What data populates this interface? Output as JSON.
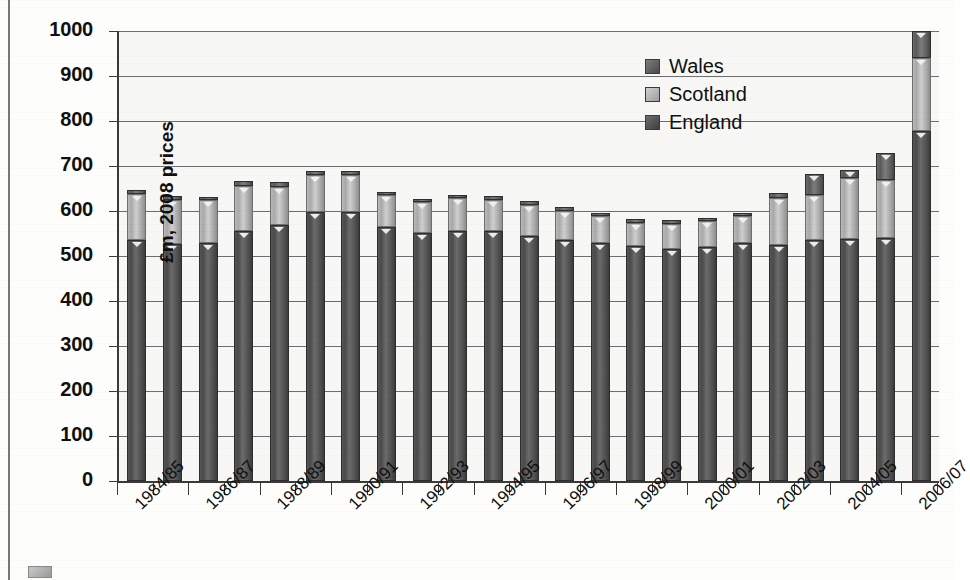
{
  "chart_data": {
    "type": "bar",
    "subtype": "stacked",
    "title": "",
    "xlabel": "",
    "ylabel": "£m, 2008 prices",
    "ylim": [
      0,
      1000
    ],
    "ytick_step": 100,
    "yticks": [
      "0",
      "100",
      "200",
      "300",
      "400",
      "500",
      "600",
      "700",
      "800",
      "900",
      "1000"
    ],
    "grid": true,
    "legend_position": "top-right",
    "categories": [
      "1984/85",
      "1985/86",
      "1986/87",
      "1987/88",
      "1988/89",
      "1989/90",
      "1990/91",
      "1991/92",
      "1992/93",
      "1993/94",
      "1994/95",
      "1995/96",
      "1996/97",
      "1997/98",
      "1998/99",
      "1999/00",
      "2000/01",
      "2001/02",
      "2002/03",
      "2003/04",
      "2004/05",
      "2005/06",
      "2006/07"
    ],
    "visible_tick_labels": [
      "1984/85",
      "1986/87",
      "1988/89",
      "1990/91",
      "1992/93",
      "1994/95",
      "1996/97",
      "1998/99",
      "2000/01",
      "2002/03",
      "2004/05",
      "2006/07"
    ],
    "series": [
      {
        "name": "England",
        "color": "#4a4a4a",
        "values": [
          535,
          527,
          528,
          556,
          570,
          598,
          598,
          565,
          552,
          556,
          556,
          545,
          535,
          528,
          522,
          515,
          520,
          530,
          525,
          535,
          538,
          540,
          778
        ]
      },
      {
        "name": "Scotland",
        "color": "#b4b4b4",
        "values": [
          103,
          98,
          96,
          100,
          84,
          82,
          82,
          70,
          67,
          72,
          68,
          68,
          65,
          60,
          52,
          56,
          57,
          58,
          105,
          100,
          135,
          130,
          162
        ]
      },
      {
        "name": "Wales",
        "color": "#6a6a6a",
        "values": [
          8,
          8,
          8,
          10,
          10,
          10,
          10,
          8,
          8,
          8,
          9,
          9,
          9,
          8,
          8,
          8,
          8,
          8,
          10,
          48,
          18,
          60,
          60
        ]
      }
    ],
    "totals": [
      646,
      633,
      632,
      666,
      664,
      690,
      690,
      643,
      627,
      636,
      633,
      622,
      609,
      596,
      582,
      579,
      585,
      596,
      640,
      683,
      691,
      730,
      1000
    ]
  },
  "legend": {
    "items": [
      {
        "label": "Wales",
        "key": "wales"
      },
      {
        "label": "Scotland",
        "key": "scotland"
      },
      {
        "label": "England",
        "key": "england"
      }
    ]
  },
  "axis": {
    "y_title": "£m, 2008 prices"
  }
}
